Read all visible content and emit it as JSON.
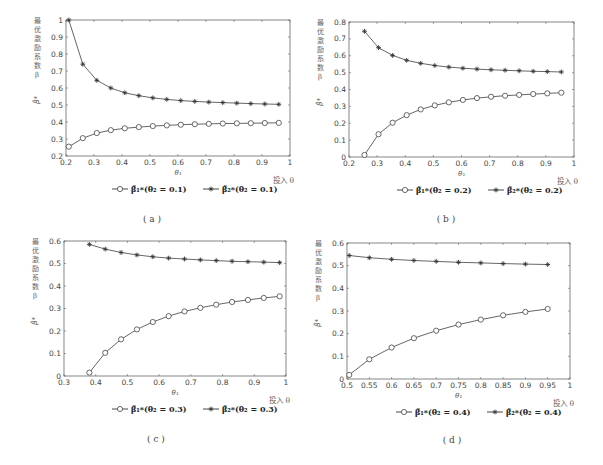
{
  "common": {
    "ylabel_cn": [
      "最",
      "优",
      "激",
      "励",
      "系",
      "数",
      "β"
    ],
    "ylabel_symbol": "β̃*",
    "xlabel": "θ₁",
    "x_note": "投入 θ",
    "line_color": "#555555",
    "axis_color": "#666666"
  },
  "chart_data": [
    {
      "id": "a",
      "type": "line",
      "caption": "( a )",
      "title": "",
      "xlabel": "θ₁",
      "ylabel": "最优激励系数 β  β̃*",
      "xlim": [
        0.2,
        1.0
      ],
      "ylim": [
        0.2,
        1.0
      ],
      "xticks": [
        "0.2",
        "0.3",
        "0.4",
        "0.5",
        "0.6",
        "0.7",
        "0.8",
        "0.9",
        "1"
      ],
      "yticks": [
        "0.2",
        "0.3",
        "0.4",
        "0.5",
        "0.6",
        "0.7",
        "0.8",
        "0.9",
        "1"
      ],
      "legend": [
        "β̃₁*(θ₂ = 0.1)",
        "β̃₂*(θ₂ = 0.1)"
      ],
      "x": [
        0.21,
        0.26,
        0.31,
        0.36,
        0.41,
        0.46,
        0.51,
        0.56,
        0.61,
        0.66,
        0.71,
        0.76,
        0.81,
        0.86,
        0.91,
        0.96
      ],
      "series": [
        {
          "name": "β̃₁*(θ₂ = 0.1)",
          "marker": "circle",
          "values": [
            0.255,
            0.305,
            0.335,
            0.352,
            0.363,
            0.37,
            0.376,
            0.38,
            0.384,
            0.387,
            0.389,
            0.391,
            0.392,
            0.393,
            0.394,
            0.395
          ]
        },
        {
          "name": "β̃₂*(θ₂ = 0.1)",
          "marker": "star",
          "values": [
            1.0,
            0.74,
            0.645,
            0.6,
            0.572,
            0.555,
            0.542,
            0.533,
            0.526,
            0.521,
            0.517,
            0.514,
            0.511,
            0.508,
            0.506,
            0.504
          ]
        }
      ]
    },
    {
      "id": "b",
      "type": "line",
      "caption": "( b )",
      "title": "",
      "xlabel": "θ₁",
      "ylabel": "最优激励系数 β  β̃*",
      "xlim": [
        0.2,
        1.0
      ],
      "ylim": [
        0.0,
        0.8
      ],
      "xticks": [
        "0.2",
        "0.3",
        "0.4",
        "0.5",
        "0.6",
        "0.7",
        "0.8",
        "0.9",
        "1"
      ],
      "yticks": [
        "0",
        "0.1",
        "0.2",
        "0.3",
        "0.4",
        "0.5",
        "0.6",
        "0.7",
        "0.8"
      ],
      "legend": [
        "β̃₁*(θ₂ = 0.2)",
        "β̃₂*(θ₂ = 0.2)"
      ],
      "x": [
        0.255,
        0.305,
        0.355,
        0.405,
        0.455,
        0.505,
        0.555,
        0.605,
        0.655,
        0.705,
        0.755,
        0.805,
        0.855,
        0.905,
        0.955
      ],
      "series": [
        {
          "name": "β̃₁*(θ₂ = 0.2)",
          "marker": "circle",
          "values": [
            0.012,
            0.135,
            0.203,
            0.248,
            0.282,
            0.306,
            0.324,
            0.338,
            0.349,
            0.357,
            0.363,
            0.368,
            0.373,
            0.377,
            0.381
          ]
        },
        {
          "name": "β̃₂*(θ₂ = 0.2)",
          "marker": "star",
          "values": [
            0.745,
            0.648,
            0.602,
            0.573,
            0.555,
            0.542,
            0.533,
            0.526,
            0.521,
            0.517,
            0.514,
            0.511,
            0.508,
            0.506,
            0.504
          ]
        }
      ]
    },
    {
      "id": "c",
      "type": "line",
      "caption": "( c )",
      "title": "",
      "xlabel": "θ₁",
      "ylabel": "最优激励系数 β  β̃*",
      "xlim": [
        0.3,
        1.0
      ],
      "ylim": [
        0.0,
        0.6
      ],
      "xticks": [
        "0.3",
        "0.4",
        "0.5",
        "0.6",
        "0.7",
        "0.8",
        "0.9",
        "1"
      ],
      "yticks": [
        "0",
        "0.1",
        "0.2",
        "0.3",
        "0.4",
        "0.5",
        "0.6"
      ],
      "legend": [
        "β̃₁*(θ₂ = 0.3)",
        "β̃₂*(θ₂ = 0.3)"
      ],
      "x": [
        0.38,
        0.43,
        0.48,
        0.53,
        0.58,
        0.63,
        0.68,
        0.73,
        0.78,
        0.83,
        0.88,
        0.93,
        0.98
      ],
      "series": [
        {
          "name": "β̃₁*(θ₂ = 0.3)",
          "marker": "circle",
          "values": [
            0.015,
            0.103,
            0.163,
            0.207,
            0.24,
            0.266,
            0.287,
            0.303,
            0.317,
            0.329,
            0.338,
            0.347,
            0.354
          ]
        },
        {
          "name": "β̃₂*(θ₂ = 0.3)",
          "marker": "star",
          "values": [
            0.585,
            0.564,
            0.549,
            0.538,
            0.53,
            0.524,
            0.52,
            0.516,
            0.513,
            0.51,
            0.508,
            0.506,
            0.504
          ]
        }
      ]
    },
    {
      "id": "d",
      "type": "line",
      "caption": "( d )",
      "title": "",
      "xlabel": "θ₁",
      "ylabel": "最优激励系数 β  β̃*",
      "xlim": [
        0.5,
        1.0
      ],
      "ylim": [
        0.0,
        0.6
      ],
      "xticks": [
        "0.5",
        "0.55",
        "0.6",
        "0.65",
        "0.7",
        "0.75",
        "0.8",
        "0.85",
        "0.9",
        "0.95",
        "1"
      ],
      "yticks": [
        "0",
        "0.1",
        "0.2",
        "0.3",
        "0.4",
        "0.5",
        "0.6"
      ],
      "legend": [
        "β̃₁*(θ₂ = 0.4)",
        "β̃₂*(θ₂ = 0.4)"
      ],
      "x": [
        0.505,
        0.55,
        0.6,
        0.65,
        0.7,
        0.75,
        0.8,
        0.85,
        0.9,
        0.95
      ],
      "series": [
        {
          "name": "β̃₁*(θ₂ = 0.4)",
          "marker": "circle",
          "values": [
            0.018,
            0.087,
            0.139,
            0.18,
            0.213,
            0.24,
            0.262,
            0.281,
            0.296,
            0.309
          ]
        },
        {
          "name": "β̃₂*(θ₂ = 0.4)",
          "marker": "star",
          "values": [
            0.545,
            0.535,
            0.528,
            0.523,
            0.519,
            0.515,
            0.512,
            0.509,
            0.507,
            0.505
          ]
        }
      ]
    }
  ],
  "layout": [
    {
      "left": 66,
      "top": 20,
      "right": 290,
      "bottom": 156,
      "legend_y": 192,
      "legend_x": 112,
      "caption_y": 222,
      "caption_x": 152
    },
    {
      "left": 349,
      "top": 22,
      "right": 574,
      "bottom": 157,
      "legend_y": 193,
      "legend_x": 397,
      "caption_y": 222,
      "caption_x": 446
    },
    {
      "left": 64,
      "top": 241,
      "right": 286,
      "bottom": 376,
      "legend_y": 412,
      "legend_x": 112,
      "caption_y": 442,
      "caption_x": 156
    },
    {
      "left": 347,
      "top": 243,
      "right": 570,
      "bottom": 379,
      "legend_y": 415,
      "legend_x": 396,
      "caption_y": 443,
      "caption_x": 452
    }
  ]
}
